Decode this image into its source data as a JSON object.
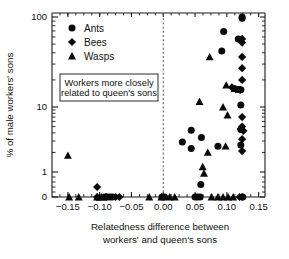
{
  "figure": {
    "title": "",
    "background": "#ffffff",
    "marker_color": "#0a0a0a",
    "axis_color": "#1a1a1a"
  },
  "annotation": {
    "line1": "Workers more closely",
    "line2": "related to queen's sons"
  },
  "legend": {
    "entries": [
      {
        "label": "Ants",
        "marker": "circle"
      },
      {
        "label": "Bees",
        "marker": "diamond"
      },
      {
        "label": "Wasps",
        "marker": "triangle"
      }
    ]
  },
  "chart_data": {
    "type": "scatter",
    "title": "",
    "xlabel": "Relatedness difference between workers' and queen's sons",
    "xlabel_line1": "Relatedness difference between",
    "xlabel_line2": "workers' and queen's sons",
    "ylabel": "% of male workers' sons",
    "xlim": [
      -0.175,
      0.16
    ],
    "ylim_labels": [
      "0",
      "1",
      "10",
      "100"
    ],
    "yscale": "log-with-zero",
    "xticks": [
      -0.15,
      -0.1,
      -0.05,
      0.0,
      0.05,
      0.1,
      0.15
    ],
    "xticklabels": [
      "−0.15",
      "−0.10",
      "−0.05",
      "0.00",
      "0.05",
      "0.10",
      "0.15"
    ],
    "yticks": [
      0,
      1,
      10,
      100
    ],
    "yticklabels": [
      "0",
      "1",
      "10",
      "100"
    ],
    "grid": false,
    "legend_position": "top-left-inside",
    "reference_line": {
      "x": 0.0,
      "style": "dashed",
      "label": "zero relatedness difference"
    },
    "series": [
      {
        "name": "Ants",
        "marker": "circle",
        "points": [
          [
            -0.092,
            0
          ],
          [
            -0.088,
            0
          ],
          [
            -0.084,
            0
          ],
          [
            -0.08,
            0
          ],
          [
            -0.002,
            0
          ],
          [
            0.002,
            0
          ],
          [
            0.05,
            0
          ],
          [
            0.054,
            0
          ],
          [
            0.058,
            0
          ],
          [
            0.125,
            0
          ],
          [
            0.059,
            0.5
          ],
          [
            0.03,
            2.9
          ],
          [
            0.044,
            2.3
          ],
          [
            0.044,
            4.4
          ],
          [
            0.06,
            3.4
          ],
          [
            0.086,
            2.5
          ],
          [
            0.122,
            2.6
          ],
          [
            0.122,
            4.5
          ],
          [
            0.122,
            10.5
          ],
          [
            0.122,
            15.5
          ],
          [
            0.118,
            15.6
          ],
          [
            0.092,
            42
          ],
          [
            0.095,
            69
          ],
          [
            0.118,
            57
          ],
          [
            0.124,
            100
          ],
          [
            0.124,
            97
          ]
        ]
      },
      {
        "name": "Bees",
        "marker": "diamond",
        "points": [
          [
            -0.104,
            0
          ],
          [
            -0.104,
            0.4
          ],
          [
            -0.09,
            0
          ],
          [
            -0.075,
            0
          ],
          [
            -0.069,
            0
          ],
          [
            0.12,
            0
          ],
          [
            0.124,
            0
          ],
          [
            0.124,
            2.1
          ],
          [
            0.124,
            3.2
          ],
          [
            0.122,
            4.6
          ],
          [
            0.126,
            4.3
          ],
          [
            0.124,
            5.0
          ],
          [
            0.124,
            7.0
          ],
          [
            0.121,
            15.5
          ],
          [
            0.108,
            16.5
          ],
          [
            0.114,
            15.8
          ],
          [
            0.124,
            20
          ],
          [
            0.124,
            27
          ],
          [
            0.124,
            36
          ],
          [
            0.124,
            52
          ],
          [
            0.124,
            57
          ]
        ]
      },
      {
        "name": "Wasps",
        "marker": "triangle",
        "points": [
          [
            -0.15,
            1.8
          ],
          [
            -0.148,
            0
          ],
          [
            -0.133,
            0
          ],
          [
            -0.104,
            0
          ],
          [
            -0.1,
            0
          ],
          [
            -0.097,
            0
          ],
          [
            -0.022,
            0
          ],
          [
            -0.003,
            0
          ],
          [
            0.01,
            0
          ],
          [
            0.018,
            0
          ],
          [
            0.076,
            0
          ],
          [
            0.086,
            0
          ],
          [
            0.094,
            0
          ],
          [
            0.102,
            0
          ],
          [
            0.11,
            0
          ],
          [
            0.062,
            1.2
          ],
          [
            0.064,
            0.95
          ],
          [
            0.07,
            2.0
          ],
          [
            0.098,
            2.5
          ],
          [
            0.101,
            7.5
          ],
          [
            0.094,
            10.0
          ],
          [
            0.057,
            11.5
          ],
          [
            0.073,
            36
          ],
          [
            0.099,
            17.5
          ],
          [
            0.112,
            16.0
          ]
        ]
      }
    ]
  }
}
